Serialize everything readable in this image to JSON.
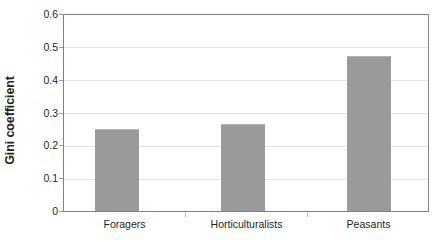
{
  "chart_data": {
    "type": "bar",
    "title": "",
    "xlabel": "",
    "ylabel": "Gini coefficient",
    "categories": [
      "Foragers",
      "Horticulturalists",
      "Peasants"
    ],
    "values": [
      0.25,
      0.265,
      0.475
    ],
    "ylim": [
      0,
      0.6
    ],
    "ytick_labels": [
      "0.6",
      "0.5",
      "0.4",
      "0.3",
      "0.2",
      "0.1",
      "0"
    ],
    "ytick_values": [
      0.6,
      0.5,
      0.4,
      0.3,
      0.2,
      0.1,
      0
    ],
    "grid": true,
    "grid_axis": "y",
    "legend": false,
    "legend_position": "none",
    "bar_color": "#9a9a9a",
    "grid_color": "#e3e3e3",
    "axis_color": "#808080",
    "text_color": "#231f20",
    "background_color": "#ffffff"
  }
}
